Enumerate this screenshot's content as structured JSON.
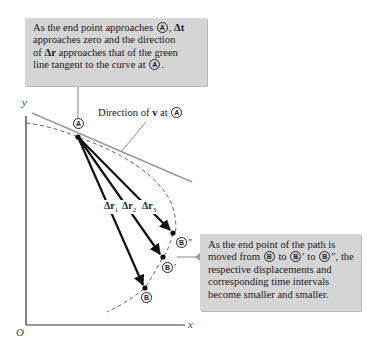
{
  "callouts": {
    "top": {
      "line1_pre": "As the end point approaches ",
      "line1_point": "A",
      "line1_post": ", ",
      "delta_t": "Δt",
      "line2": "approaches zero and the direction",
      "line3_pre": "of ",
      "delta_r": "Δr",
      "line3_post": " approaches that of the green",
      "line4_pre": "line tangent to the curve at ",
      "line4_point": "A",
      "line4_post": "."
    },
    "right": {
      "line1": "As the end point of the path is",
      "line2_pre": "moved from ",
      "p1": "B",
      "to1": " to ",
      "p2": "B",
      "p2_prime": "′",
      "to2": " to ",
      "p3": "B",
      "p3_prime": "″",
      "line2_post": ", the",
      "line3": "respective displacements and",
      "line4": "corresponding time intervals",
      "line5": "become smaller and smaller."
    }
  },
  "diagram": {
    "axes": {
      "y_label": "y",
      "x_label": "x",
      "origin_label": "O"
    },
    "tangent_label": {
      "pre": "Direction of ",
      "vec": "v",
      "post": " at ",
      "point": "A"
    },
    "points": {
      "A": "A",
      "B": "B",
      "B_prime": "B",
      "B_prime_mark": "′",
      "B_double": "B",
      "B_double_mark": "″"
    },
    "displacements": [
      {
        "label": "Δr",
        "sub": "1"
      },
      {
        "label": "Δr",
        "sub": "2"
      },
      {
        "label": "Δr",
        "sub": "3"
      }
    ],
    "colors": {
      "callout_bg": "#d5d5d5",
      "tangent_line": "#9a9a9a",
      "vectors": "#111111",
      "curve": "#555555"
    }
  }
}
